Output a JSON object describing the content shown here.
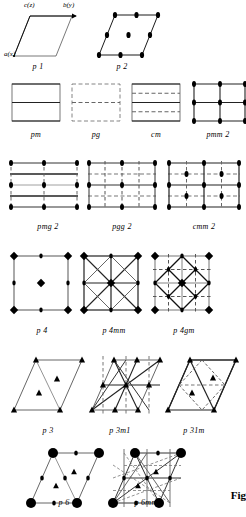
{
  "figure": {
    "title_tag": "Fig",
    "axes": {
      "c_label": "c(z)",
      "b_label": "b(y)",
      "a_label": "a(x)"
    },
    "rows": [
      {
        "row": 1,
        "cells": [
          {
            "label": "p 1"
          },
          {
            "label": "p 2"
          }
        ]
      },
      {
        "row": 2,
        "cells": [
          {
            "label": "pm"
          },
          {
            "label": "pg"
          },
          {
            "label": "cm"
          },
          {
            "label": "pmm 2"
          }
        ]
      },
      {
        "row": 3,
        "cells": [
          {
            "label": "pmg 2"
          },
          {
            "label": "pgg 2"
          },
          {
            "label": "cmm 2"
          }
        ]
      },
      {
        "row": 4,
        "cells": [
          {
            "label": "p 4"
          },
          {
            "label": "p 4mm"
          },
          {
            "label": "p 4gm"
          }
        ]
      },
      {
        "row": 5,
        "cells": [
          {
            "label": "p 3"
          },
          {
            "label": "p 3m1"
          },
          {
            "label": "p 31m"
          }
        ]
      },
      {
        "row": 6,
        "cells": [
          {
            "label": "p 6"
          },
          {
            "label": "p 6mm"
          }
        ]
      }
    ],
    "labels": {
      "p1": "p 1",
      "p2": "p 2",
      "pm": "pm",
      "pg": "pg",
      "cm": "cm",
      "pmm2": "pmm 2",
      "pmg2": "pmg 2",
      "pgg2": "pgg 2",
      "cmm2": "cmm 2",
      "p4": "p 4",
      "p4mm": "p 4mm",
      "p4gm": "p 4gm",
      "p3": "p 3",
      "p3m1": "p 3m1",
      "p31m": "p 31m",
      "p6": "p 6",
      "p6mm": "p 6mm"
    },
    "symbols": {
      "two_fold": "lens-marker",
      "three_fold": "triangle-marker",
      "four_fold": "diamond-marker",
      "six_fold": "hexagon-marker",
      "mirror_line": "solid-line",
      "glide_line": "dashed-line"
    },
    "colors": {
      "ink": "#000000",
      "paper": "#ffffff",
      "light_ink": "#555555"
    }
  }
}
